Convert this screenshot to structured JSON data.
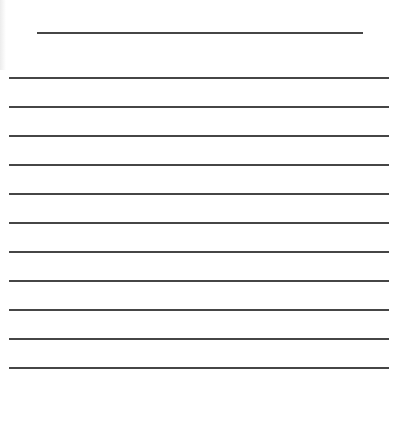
{
  "document": {
    "type": "lined-writing-sheet",
    "line_color": "#464646",
    "title_line": {
      "left": 37,
      "top": 32,
      "width": 326
    },
    "rules": {
      "left": 9,
      "width": 380,
      "tops": [
        77,
        106,
        135,
        164,
        193,
        222,
        251,
        280,
        309,
        338,
        367
      ]
    }
  }
}
